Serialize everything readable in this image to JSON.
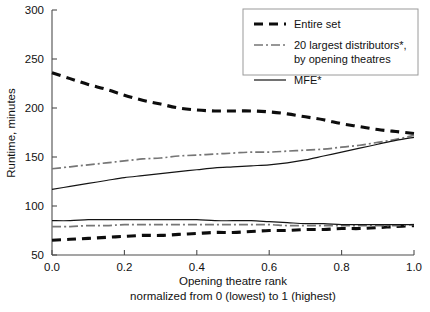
{
  "chart_data": {
    "type": "line",
    "title": "",
    "xlabel": "Opening theatre rank",
    "xlabel_line2": "normalized from 0 (lowest) to 1 (highest)",
    "ylabel": "Runtime, minutes",
    "xlim": [
      0.0,
      1.0
    ],
    "ylim": [
      50,
      300
    ],
    "grid": false,
    "legend_position": "top-right",
    "xticks": [
      "0.0",
      "0.2",
      "0.4",
      "0.6",
      "0.8",
      "1.0"
    ],
    "xtick_values": [
      0.0,
      0.2,
      0.4,
      0.6,
      0.8,
      1.0
    ],
    "yticks": [
      "50",
      "100",
      "150",
      "200",
      "250",
      "300"
    ],
    "ytick_values": [
      50,
      100,
      150,
      200,
      250,
      300
    ],
    "x": [
      0.0,
      0.05,
      0.1,
      0.15,
      0.2,
      0.25,
      0.3,
      0.35,
      0.4,
      0.45,
      0.5,
      0.55,
      0.6,
      0.65,
      0.7,
      0.75,
      0.8,
      0.85,
      0.9,
      0.95,
      1.0
    ],
    "series": [
      {
        "name": "Entire set",
        "band": "upper",
        "style": "dashed",
        "color": "#0d0d0d",
        "values": [
          236,
          230,
          224,
          219,
          213,
          208,
          204,
          200,
          198,
          197,
          197,
          197,
          196,
          194,
          191,
          188,
          184,
          181,
          178,
          176,
          174
        ]
      },
      {
        "name": "20 largest distributors*, by opening theatres",
        "band": "upper",
        "style": "dash-dot",
        "color": "#767676",
        "values": [
          138,
          140,
          142,
          144,
          146,
          148,
          149,
          151,
          152,
          153,
          154,
          155,
          155,
          156,
          157,
          158,
          160,
          162,
          165,
          168,
          172
        ]
      },
      {
        "name": "MFE*",
        "band": "upper",
        "style": "solid",
        "color": "#141414",
        "values": [
          117,
          120,
          123,
          126,
          129,
          131,
          133,
          135,
          137,
          139,
          140,
          141,
          142,
          144,
          147,
          151,
          155,
          159,
          163,
          167,
          170
        ]
      },
      {
        "name": "Entire set",
        "band": "lower",
        "style": "dashed",
        "color": "#0d0d0d",
        "values": [
          65,
          66,
          67,
          68,
          69,
          70,
          70,
          71,
          72,
          73,
          73,
          74,
          75,
          75,
          76,
          76,
          77,
          77,
          78,
          79,
          80
        ]
      },
      {
        "name": "20 largest distributors*, by opening theatres",
        "band": "lower",
        "style": "dash-dot",
        "color": "#767676",
        "values": [
          79,
          79,
          80,
          80,
          81,
          81,
          81,
          81,
          81,
          81,
          81,
          81,
          81,
          80,
          80,
          80,
          80,
          80,
          80,
          80,
          81
        ]
      },
      {
        "name": "MFE*",
        "band": "lower",
        "style": "solid",
        "color": "#141414",
        "values": [
          85,
          85,
          86,
          86,
          86,
          86,
          86,
          86,
          86,
          85,
          85,
          85,
          84,
          83,
          82,
          82,
          81,
          81,
          81,
          81,
          81
        ]
      }
    ]
  },
  "legend": {
    "items": [
      {
        "label": "Entire set",
        "label2": "",
        "style": "dashed"
      },
      {
        "label": "20 largest distributors*,",
        "label2": "by opening theatres",
        "style": "dash-dot"
      },
      {
        "label": "MFE*",
        "label2": "",
        "style": "solid"
      }
    ]
  }
}
